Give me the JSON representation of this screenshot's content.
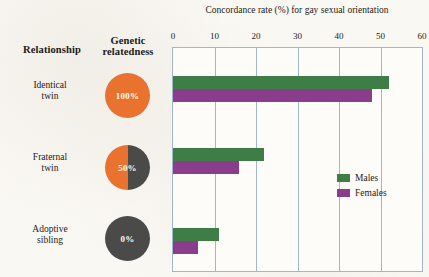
{
  "table": {
    "headers": {
      "relationship": "Relationship",
      "relatedness_line1": "Genetic",
      "relatedness_line2": "relatedness"
    },
    "rows": [
      {
        "label_line1": "Identical",
        "label_line2": "twin",
        "relatedness_pct": "100%",
        "relatedness_value": 100
      },
      {
        "label_line1": "Fraternal",
        "label_line2": "twin",
        "relatedness_pct": "50%",
        "relatedness_value": 50
      },
      {
        "label_line1": "Adoptive",
        "label_line2": "sibling",
        "relatedness_pct": "0%",
        "relatedness_value": 0
      }
    ]
  },
  "legend": {
    "position": "inside-right",
    "entries": [
      {
        "label": "Males",
        "color": "#3e7d45"
      },
      {
        "label": "Females",
        "color": "#8a3d8a"
      }
    ]
  },
  "colors": {
    "males": "#3e7d45",
    "females": "#8a3d8a",
    "related_orange": "#e8722e",
    "unrelated_gray": "#4a4a48",
    "plot_frame": "#9fb6cc",
    "background": "#faf8f3",
    "text": "#1d1a17"
  },
  "chart_data": {
    "type": "bar",
    "orientation": "horizontal",
    "title": "Concordance rate (%) for gay sexual orientation",
    "xlabel": "Concordance rate (%) for gay sexual orientation",
    "ylabel": "",
    "categories": [
      "Identical twin",
      "Fraternal twin",
      "Adoptive sibling"
    ],
    "series": [
      {
        "name": "Males",
        "color": "#3e7d45",
        "values": [
          52,
          22,
          11
        ]
      },
      {
        "name": "Females",
        "color": "#8a3d8a",
        "values": [
          48,
          16,
          6
        ]
      }
    ],
    "xlim": [
      0,
      60
    ],
    "xticks": [
      0,
      10,
      20,
      30,
      40,
      50,
      60
    ],
    "xtick_labels": [
      "0",
      "10",
      "20",
      "30",
      "40",
      "50",
      "60"
    ],
    "grid": "vertical",
    "legend": "inside-right"
  }
}
